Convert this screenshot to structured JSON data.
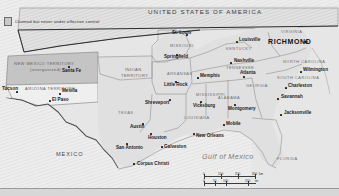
{
  "map": {
    "legend": {
      "text": "Claimed but never under effective control",
      "swatch_color": "#c9c9c9"
    },
    "countries": [
      {
        "name": "UNITED STATES OF AMERICA",
        "x": 148,
        "y": 9
      },
      {
        "name": "MEXICO",
        "x": 56,
        "y": 152
      }
    ],
    "water_bodies": [
      {
        "name": "Gulf of Mexico",
        "x": 202,
        "y": 157
      }
    ],
    "territories": [
      {
        "name": "NEW MEXICO TERRITORY",
        "sub": "(unorganized)",
        "x": 14,
        "y": 62
      },
      {
        "name": "ARIZONA TERRITORY",
        "sub": "",
        "x": 25,
        "y": 87
      },
      {
        "name": "INDIAN",
        "sub": "TERRITORY",
        "x": 125,
        "y": 68
      }
    ],
    "states": [
      {
        "name": "MISSOURI",
        "x": 170,
        "y": 44
      },
      {
        "name": "KENTUCKY",
        "x": 226,
        "y": 47
      },
      {
        "name": "VIRGINIA",
        "x": 281,
        "y": 30
      },
      {
        "name": "TENNESSEE",
        "x": 226,
        "y": 66
      },
      {
        "name": "NORTH CAROLINA",
        "x": 283,
        "y": 60
      },
      {
        "name": "SOUTH CAROLINA",
        "x": 277,
        "y": 76
      },
      {
        "name": "ARKANSAS",
        "x": 167,
        "y": 72
      },
      {
        "name": "MISSISSIPPI",
        "x": 196,
        "y": 93
      },
      {
        "name": "ALABAMA",
        "x": 218,
        "y": 96
      },
      {
        "name": "GEORGIA",
        "x": 246,
        "y": 84
      },
      {
        "name": "LOUISIANA",
        "x": 184,
        "y": 116
      },
      {
        "name": "TEXAS",
        "x": 118,
        "y": 111
      },
      {
        "name": "FLORIDA",
        "x": 277,
        "y": 157
      }
    ],
    "cities": [
      {
        "name": "St. Louis",
        "x": 172,
        "y": 33,
        "capital": false,
        "anchor": "right"
      },
      {
        "name": "Springfield",
        "x": 164,
        "y": 57,
        "capital": false,
        "anchor": "right"
      },
      {
        "name": "Louisville",
        "x": 238,
        "y": 39,
        "capital": false,
        "anchor": "left"
      },
      {
        "name": "RICHMOND",
        "x": 274,
        "y": 41,
        "capital": true,
        "anchor": "left"
      },
      {
        "name": "Nashville",
        "x": 233,
        "y": 60,
        "capital": false,
        "anchor": "left"
      },
      {
        "name": "Memphis",
        "x": 200,
        "y": 75,
        "capital": false,
        "anchor": "left"
      },
      {
        "name": "Little Rock",
        "x": 167,
        "y": 84,
        "capital": false,
        "anchor": "left"
      },
      {
        "name": "Atlanta",
        "x": 245,
        "y": 74,
        "capital": false,
        "anchor": "left"
      },
      {
        "name": "Wilmington",
        "x": 302,
        "y": 69,
        "capital": false,
        "anchor": "left"
      },
      {
        "name": "Charleston",
        "x": 287,
        "y": 85,
        "capital": false,
        "anchor": "left"
      },
      {
        "name": "Savannah",
        "x": 280,
        "y": 96,
        "capital": false,
        "anchor": "left"
      },
      {
        "name": "Jacksonville",
        "x": 283,
        "y": 112,
        "capital": false,
        "anchor": "left"
      },
      {
        "name": "Vicksburg",
        "x": 196,
        "y": 104,
        "capital": false,
        "anchor": "left"
      },
      {
        "name": "Montgomery",
        "x": 230,
        "y": 108,
        "capital": false,
        "anchor": "left"
      },
      {
        "name": "Mobile",
        "x": 226,
        "y": 123,
        "capital": false,
        "anchor": "left"
      },
      {
        "name": "New Orleans",
        "x": 196,
        "y": 135,
        "capital": false,
        "anchor": "left"
      },
      {
        "name": "Shreveport",
        "x": 145,
        "y": 103,
        "capital": false,
        "anchor": "left"
      },
      {
        "name": "Austin",
        "x": 132,
        "y": 126,
        "capital": false,
        "anchor": "left"
      },
      {
        "name": "Houston",
        "x": 152,
        "y": 136,
        "capital": false,
        "anchor": "left"
      },
      {
        "name": "Galveston",
        "x": 163,
        "y": 147,
        "capital": false,
        "anchor": "left"
      },
      {
        "name": "San Antonio",
        "x": 119,
        "y": 147,
        "capital": false,
        "anchor": "left"
      },
      {
        "name": "Corpus Christi",
        "x": 138,
        "y": 163,
        "capital": false,
        "anchor": "left"
      },
      {
        "name": "Santa Fe",
        "x": 64,
        "y": 70,
        "capital": false,
        "anchor": "left"
      },
      {
        "name": "Tucson",
        "x": 5,
        "y": 88,
        "capital": false,
        "anchor": "left"
      },
      {
        "name": "Mesilla",
        "x": 62,
        "y": 90,
        "capital": false,
        "anchor": "left"
      },
      {
        "name": "El Paso",
        "x": 53,
        "y": 99,
        "capital": false,
        "anchor": "left"
      }
    ],
    "scale": {
      "km": {
        "unit": "km",
        "ticks": [
          "0",
          "100",
          "200",
          "300"
        ]
      },
      "mi": {
        "unit": "mi",
        "ticks": [
          "0",
          "50",
          "100",
          "200"
        ]
      }
    }
  }
}
